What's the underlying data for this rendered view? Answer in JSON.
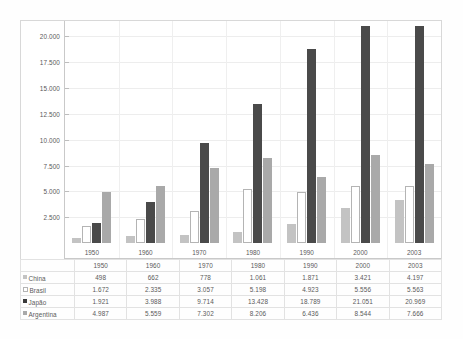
{
  "chart_data": {
    "type": "bar",
    "title": "",
    "subtitle": "",
    "xlabel": "",
    "ylabel": "",
    "categories": [
      "1950",
      "1960",
      "1970",
      "1980",
      "1990",
      "2000",
      "2003"
    ],
    "series": [
      {
        "name": "China",
        "color": "#c3c3c3",
        "values": [
          498,
          662,
          778,
          1061,
          1871,
          3421,
          4197
        ],
        "labels": [
          "498",
          "662",
          "778",
          "1.061",
          "1.871",
          "3.421",
          "4.197"
        ]
      },
      {
        "name": "Brasil",
        "color": "#ffffff",
        "values": [
          1672,
          2335,
          3057,
          5198,
          4923,
          5556,
          5563
        ],
        "labels": [
          "1.672",
          "2.335",
          "3.057",
          "5.198",
          "4.923",
          "5.556",
          "5.563"
        ]
      },
      {
        "name": "Japão",
        "color": "#4a4a4a",
        "values": [
          1921,
          3988,
          9714,
          13428,
          18789,
          21051,
          20969
        ],
        "labels": [
          "1.921",
          "3.988",
          "9.714",
          "13.428",
          "18.789",
          "21.051",
          "20.969"
        ]
      },
      {
        "name": "Argentina",
        "color": "#a9a9a9",
        "values": [
          4987,
          5559,
          7302,
          8206,
          6436,
          8544,
          7666
        ],
        "labels": [
          "4.987",
          "5.559",
          "7.302",
          "8.206",
          "6.436",
          "8.544",
          "7.666"
        ]
      }
    ],
    "ylim": [
      0,
      21500
    ],
    "yticks": [
      2500,
      5000,
      7500,
      10000,
      12500,
      15000,
      17500,
      20000
    ],
    "ytick_labels": [
      "2.500",
      "5.000",
      "7.500",
      "10.000",
      "12.500",
      "15.000",
      "17.500",
      "20.000"
    ],
    "grid": true,
    "legend_position": "table-row-labels"
  },
  "table": {
    "corner_label": "",
    "column_headers": [
      "1950",
      "1960",
      "1970",
      "1980",
      "1990",
      "2000",
      "2003"
    ],
    "rows": [
      {
        "label": "China",
        "swatch": "china-swatch-icon",
        "values": [
          "498",
          "662",
          "778",
          "1.061",
          "1.871",
          "3.421",
          "4.197"
        ]
      },
      {
        "label": "Brasil",
        "swatch": "brasil-swatch-icon",
        "values": [
          "1.672",
          "2.335",
          "3.057",
          "5.198",
          "4.923",
          "5.556",
          "5.563"
        ]
      },
      {
        "label": "Japão",
        "swatch": "japao-swatch-icon",
        "values": [
          "1.921",
          "3.988",
          "9.714",
          "13.428",
          "18.789",
          "21.051",
          "20.969"
        ]
      },
      {
        "label": "Argentina",
        "swatch": "argentina-swatch-icon",
        "values": [
          "4.987",
          "5.559",
          "7.302",
          "8.206",
          "6.436",
          "8.544",
          "7.666"
        ]
      }
    ]
  },
  "colors": {
    "china": "#c3c3c3",
    "brasil": "#ffffff",
    "japao": "#4a4a4a",
    "argentina": "#a9a9a9",
    "grid": "#ededed",
    "frame": "#d8d8d8",
    "text": "#5a5a5a"
  }
}
